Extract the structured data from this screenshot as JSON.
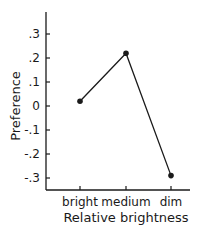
{
  "chart_data": {
    "type": "line",
    "title": "",
    "xlabel": "Relative brightness",
    "ylabel": "Preference",
    "categories": [
      "bright",
      "medium",
      "dim"
    ],
    "values": [
      0.02,
      0.22,
      -0.29
    ],
    "ylim": [
      -0.35,
      0.4
    ],
    "yticks": [
      0.3,
      0.2,
      0.1,
      0,
      -0.1,
      -0.2,
      -0.3
    ],
    "ytick_labels": [
      ".3",
      ".2",
      ".1",
      "0",
      "-.1",
      "-.2",
      "-.3"
    ],
    "grid": false,
    "legend": null,
    "markers": "filled-circle",
    "line_color": "#1a1a1a"
  }
}
